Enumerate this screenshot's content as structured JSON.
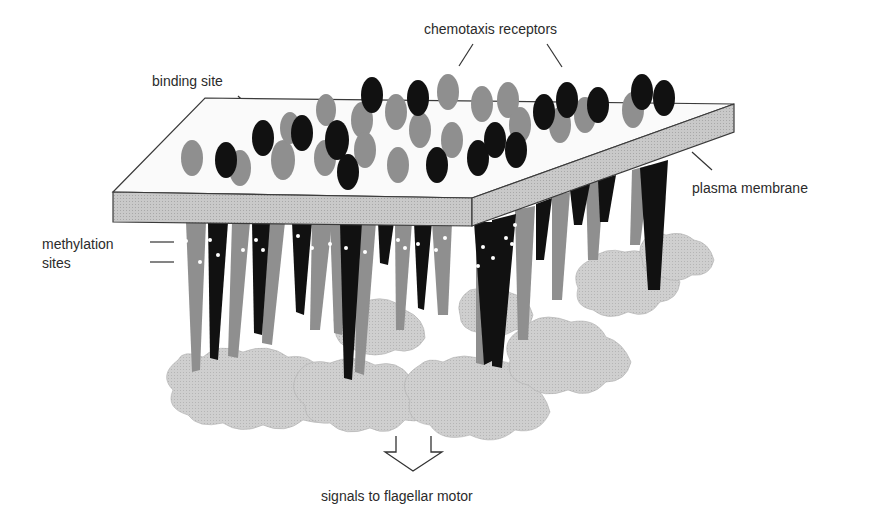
{
  "figure": {
    "labels": {
      "chemotaxis_receptors": "chemotaxis receptors",
      "binding_site": "binding site",
      "plasma_membrane": "plasma membrane",
      "methylation_sites_line1": "methylation",
      "methylation_sites_line2": "sites",
      "signals": "signals to flagellar motor"
    },
    "colors": {
      "membrane_fill": "#d2d2d2",
      "membrane_edge": "#3a3a3a",
      "receptor_light": "#8f8f8f",
      "receptor_dark": "#111111",
      "cytoplasmic_complex": "#c4c4c4",
      "methylation_dot": "#ffffff",
      "leader_line": "#333333"
    }
  }
}
